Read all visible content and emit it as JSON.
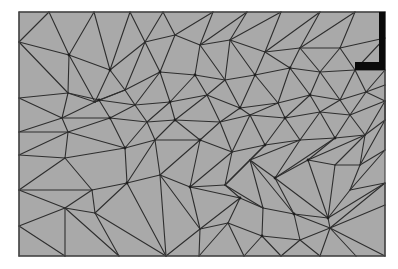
{
  "figure": {
    "type": "triangular finite element mesh",
    "background": "#ffffff",
    "domain": {
      "x": 19,
      "y": 12,
      "width": 366,
      "height": 244,
      "fill": "#a9a9a9",
      "border": "#4a4a4a"
    },
    "line_color": "#2e2e2e",
    "node_color": "#1e1e1e",
    "boundary_condition": {
      "shape": "L-bracket",
      "color": "#0a0a0a",
      "vertical_bar": {
        "x": 379,
        "y": 12,
        "width": 6,
        "height": 58
      },
      "horizontal_bar": {
        "x": 355,
        "y": 62,
        "width": 30,
        "height": 8
      }
    },
    "nodes": [
      [
        19,
        12
      ],
      [
        49,
        12
      ],
      [
        94,
        12
      ],
      [
        130,
        12
      ],
      [
        163,
        12
      ],
      [
        213,
        12
      ],
      [
        247,
        12
      ],
      [
        281,
        12
      ],
      [
        320,
        12
      ],
      [
        355,
        12
      ],
      [
        385,
        12
      ],
      [
        19,
        42
      ],
      [
        69,
        55
      ],
      [
        110,
        70
      ],
      [
        145,
        42
      ],
      [
        175,
        35
      ],
      [
        200,
        45
      ],
      [
        230,
        40
      ],
      [
        265,
        52
      ],
      [
        300,
        48
      ],
      [
        340,
        48
      ],
      [
        385,
        38
      ],
      [
        19,
        98
      ],
      [
        68,
        93
      ],
      [
        95,
        102
      ],
      [
        125,
        90
      ],
      [
        160,
        72
      ],
      [
        195,
        75
      ],
      [
        225,
        80
      ],
      [
        255,
        75
      ],
      [
        290,
        68
      ],
      [
        320,
        72
      ],
      [
        355,
        70
      ],
      [
        385,
        70
      ],
      [
        19,
        132
      ],
      [
        62,
        118
      ],
      [
        99,
        100
      ],
      [
        135,
        105
      ],
      [
        170,
        102
      ],
      [
        207,
        95
      ],
      [
        240,
        108
      ],
      [
        278,
        103
      ],
      [
        310,
        95
      ],
      [
        340,
        100
      ],
      [
        366,
        92
      ],
      [
        385,
        85
      ],
      [
        19,
        155
      ],
      [
        68,
        132
      ],
      [
        110,
        118
      ],
      [
        147,
        122
      ],
      [
        175,
        120
      ],
      [
        220,
        122
      ],
      [
        250,
        115
      ],
      [
        285,
        118
      ],
      [
        320,
        112
      ],
      [
        350,
        115
      ],
      [
        385,
        101
      ],
      [
        19,
        190
      ],
      [
        65,
        158
      ],
      [
        92,
        190
      ],
      [
        125,
        148
      ],
      [
        155,
        140
      ],
      [
        200,
        140
      ],
      [
        232,
        152
      ],
      [
        265,
        145
      ],
      [
        300,
        140
      ],
      [
        335,
        138
      ],
      [
        365,
        135
      ],
      [
        385,
        120
      ],
      [
        19,
        226
      ],
      [
        65,
        208
      ],
      [
        95,
        213
      ],
      [
        127,
        183
      ],
      [
        160,
        175
      ],
      [
        190,
        187
      ],
      [
        225,
        185
      ],
      [
        250,
        160
      ],
      [
        275,
        178
      ],
      [
        308,
        160
      ],
      [
        335,
        165
      ],
      [
        360,
        165
      ],
      [
        385,
        150
      ],
      [
        19,
        256
      ],
      [
        65,
        256
      ],
      [
        119,
        256
      ],
      [
        166,
        256
      ],
      [
        199,
        256
      ],
      [
        244,
        256
      ],
      [
        281,
        256
      ],
      [
        320,
        256
      ],
      [
        356,
        256
      ],
      [
        385,
        256
      ],
      [
        200,
        229
      ],
      [
        240,
        198
      ],
      [
        263,
        208
      ],
      [
        294,
        214
      ],
      [
        328,
        218
      ],
      [
        350,
        190
      ],
      [
        385,
        183
      ],
      [
        385,
        205
      ],
      [
        385,
        231
      ],
      [
        228,
        223
      ],
      [
        262,
        236
      ],
      [
        300,
        240
      ],
      [
        330,
        228
      ]
    ],
    "edges": [
      [
        0,
        1
      ],
      [
        1,
        2
      ],
      [
        2,
        3
      ],
      [
        3,
        4
      ],
      [
        4,
        5
      ],
      [
        5,
        6
      ],
      [
        6,
        7
      ],
      [
        7,
        8
      ],
      [
        8,
        9
      ],
      [
        9,
        10
      ],
      [
        0,
        11
      ],
      [
        11,
        22
      ],
      [
        22,
        34
      ],
      [
        34,
        46
      ],
      [
        46,
        57
      ],
      [
        57,
        69
      ],
      [
        69,
        82
      ],
      [
        82,
        83
      ],
      [
        83,
        84
      ],
      [
        84,
        85
      ],
      [
        85,
        86
      ],
      [
        86,
        87
      ],
      [
        87,
        88
      ],
      [
        88,
        89
      ],
      [
        89,
        90
      ],
      [
        90,
        91
      ],
      [
        10,
        21
      ],
      [
        21,
        33
      ],
      [
        33,
        45
      ],
      [
        45,
        56
      ],
      [
        56,
        68
      ],
      [
        68,
        81
      ],
      [
        81,
        97
      ],
      [
        97,
        98
      ],
      [
        98,
        99
      ],
      [
        99,
        91
      ],
      [
        11,
        1
      ],
      [
        11,
        12
      ],
      [
        1,
        12
      ],
      [
        12,
        2
      ],
      [
        2,
        13
      ],
      [
        12,
        13
      ],
      [
        13,
        3
      ],
      [
        3,
        14
      ],
      [
        13,
        14
      ],
      [
        14,
        4
      ],
      [
        4,
        15
      ],
      [
        14,
        15
      ],
      [
        15,
        5
      ],
      [
        15,
        16
      ],
      [
        5,
        16
      ],
      [
        16,
        6
      ],
      [
        16,
        17
      ],
      [
        6,
        17
      ],
      [
        17,
        7
      ],
      [
        17,
        18
      ],
      [
        7,
        18
      ],
      [
        18,
        8
      ],
      [
        18,
        19
      ],
      [
        8,
        19
      ],
      [
        19,
        9
      ],
      [
        19,
        20
      ],
      [
        9,
        20
      ],
      [
        20,
        21
      ],
      [
        20,
        32
      ],
      [
        21,
        32
      ],
      [
        32,
        33
      ],
      [
        11,
        23
      ],
      [
        12,
        23
      ],
      [
        23,
        22
      ],
      [
        23,
        24
      ],
      [
        12,
        24
      ],
      [
        13,
        24
      ],
      [
        13,
        25
      ],
      [
        24,
        25
      ],
      [
        14,
        25
      ],
      [
        14,
        26
      ],
      [
        25,
        26
      ],
      [
        15,
        26
      ],
      [
        26,
        27
      ],
      [
        16,
        27
      ],
      [
        16,
        28
      ],
      [
        27,
        28
      ],
      [
        17,
        28
      ],
      [
        28,
        29
      ],
      [
        17,
        29
      ],
      [
        18,
        29
      ],
      [
        29,
        30
      ],
      [
        18,
        30
      ],
      [
        19,
        30
      ],
      [
        30,
        31
      ],
      [
        19,
        31
      ],
      [
        20,
        31
      ],
      [
        31,
        32
      ],
      [
        22,
        35
      ],
      [
        23,
        35
      ],
      [
        35,
        34
      ],
      [
        23,
        36
      ],
      [
        24,
        36
      ],
      [
        35,
        36
      ],
      [
        36,
        25
      ],
      [
        36,
        37
      ],
      [
        25,
        37
      ],
      [
        37,
        26
      ],
      [
        37,
        38
      ],
      [
        26,
        38
      ],
      [
        38,
        27
      ],
      [
        38,
        39
      ],
      [
        27,
        39
      ],
      [
        39,
        28
      ],
      [
        39,
        40
      ],
      [
        28,
        40
      ],
      [
        40,
        29
      ],
      [
        40,
        41
      ],
      [
        29,
        41
      ],
      [
        41,
        30
      ],
      [
        41,
        42
      ],
      [
        30,
        42
      ],
      [
        42,
        31
      ],
      [
        42,
        43
      ],
      [
        31,
        43
      ],
      [
        43,
        32
      ],
      [
        43,
        44
      ],
      [
        32,
        44
      ],
      [
        44,
        33
      ],
      [
        44,
        45
      ],
      [
        34,
        47
      ],
      [
        35,
        47
      ],
      [
        47,
        46
      ],
      [
        35,
        48
      ],
      [
        36,
        48
      ],
      [
        47,
        48
      ],
      [
        48,
        37
      ],
      [
        48,
        49
      ],
      [
        37,
        49
      ],
      [
        49,
        38
      ],
      [
        49,
        50
      ],
      [
        38,
        50
      ],
      [
        50,
        39
      ],
      [
        50,
        51
      ],
      [
        39,
        51
      ],
      [
        51,
        40
      ],
      [
        51,
        52
      ],
      [
        40,
        52
      ],
      [
        52,
        41
      ],
      [
        52,
        53
      ],
      [
        41,
        53
      ],
      [
        53,
        42
      ],
      [
        53,
        54
      ],
      [
        42,
        54
      ],
      [
        54,
        43
      ],
      [
        54,
        55
      ],
      [
        43,
        55
      ],
      [
        55,
        44
      ],
      [
        55,
        56
      ],
      [
        44,
        56
      ],
      [
        46,
        58
      ],
      [
        47,
        58
      ],
      [
        58,
        57
      ],
      [
        47,
        60
      ],
      [
        48,
        60
      ],
      [
        58,
        60
      ],
      [
        58,
        59
      ],
      [
        59,
        57
      ],
      [
        60,
        49
      ],
      [
        60,
        61
      ],
      [
        49,
        61
      ],
      [
        61,
        50
      ],
      [
        61,
        62
      ],
      [
        50,
        62
      ],
      [
        62,
        51
      ],
      [
        62,
        63
      ],
      [
        51,
        63
      ],
      [
        63,
        52
      ],
      [
        63,
        64
      ],
      [
        52,
        64
      ],
      [
        64,
        53
      ],
      [
        64,
        65
      ],
      [
        53,
        65
      ],
      [
        65,
        54
      ],
      [
        65,
        66
      ],
      [
        54,
        66
      ],
      [
        66,
        55
      ],
      [
        66,
        67
      ],
      [
        55,
        67
      ],
      [
        67,
        56
      ],
      [
        67,
        68
      ],
      [
        56,
        68
      ],
      [
        57,
        70
      ],
      [
        59,
        70
      ],
      [
        70,
        69
      ],
      [
        59,
        71
      ],
      [
        70,
        71
      ],
      [
        59,
        72
      ],
      [
        60,
        72
      ],
      [
        71,
        72
      ],
      [
        72,
        61
      ],
      [
        72,
        73
      ],
      [
        61,
        73
      ],
      [
        73,
        62
      ],
      [
        73,
        74
      ],
      [
        62,
        74
      ],
      [
        74,
        63
      ],
      [
        74,
        75
      ],
      [
        63,
        75
      ],
      [
        75,
        64
      ],
      [
        75,
        76
      ],
      [
        64,
        76
      ],
      [
        76,
        65
      ],
      [
        76,
        77
      ],
      [
        65,
        77
      ],
      [
        77,
        66
      ],
      [
        77,
        78
      ],
      [
        66,
        78
      ],
      [
        78,
        67
      ],
      [
        78,
        79
      ],
      [
        67,
        79
      ],
      [
        79,
        80
      ],
      [
        68,
        80
      ],
      [
        80,
        81
      ],
      [
        67,
        80
      ],
      [
        69,
        83
      ],
      [
        70,
        83
      ],
      [
        70,
        84
      ],
      [
        71,
        84
      ],
      [
        71,
        85
      ],
      [
        72,
        85
      ],
      [
        73,
        85
      ],
      [
        73,
        92
      ],
      [
        74,
        92
      ],
      [
        85,
        92
      ],
      [
        92,
        86
      ],
      [
        74,
        93
      ],
      [
        75,
        93
      ],
      [
        92,
        93
      ],
      [
        93,
        101
      ],
      [
        92,
        101
      ],
      [
        101,
        86
      ],
      [
        101,
        87
      ],
      [
        93,
        94
      ],
      [
        76,
        94
      ],
      [
        75,
        94
      ],
      [
        94,
        102
      ],
      [
        101,
        102
      ],
      [
        102,
        87
      ],
      [
        102,
        88
      ],
      [
        94,
        95
      ],
      [
        76,
        95
      ],
      [
        77,
        95
      ],
      [
        95,
        103
      ],
      [
        102,
        103
      ],
      [
        103,
        88
      ],
      [
        103,
        89
      ],
      [
        95,
        104
      ],
      [
        103,
        104
      ],
      [
        104,
        89
      ],
      [
        104,
        90
      ],
      [
        95,
        96
      ],
      [
        77,
        96
      ],
      [
        78,
        96
      ],
      [
        79,
        96
      ],
      [
        96,
        97
      ],
      [
        80,
        97
      ],
      [
        96,
        98
      ],
      [
        104,
        98
      ],
      [
        104,
        99
      ],
      [
        96,
        104
      ],
      [
        104,
        91
      ]
    ],
    "highlighted_nodes": [
      12,
      13,
      26,
      27,
      29,
      30,
      36,
      38,
      40,
      42,
      48,
      50,
      53,
      60,
      62,
      64,
      66,
      72,
      74,
      77,
      78,
      93,
      95,
      96,
      102
    ]
  }
}
